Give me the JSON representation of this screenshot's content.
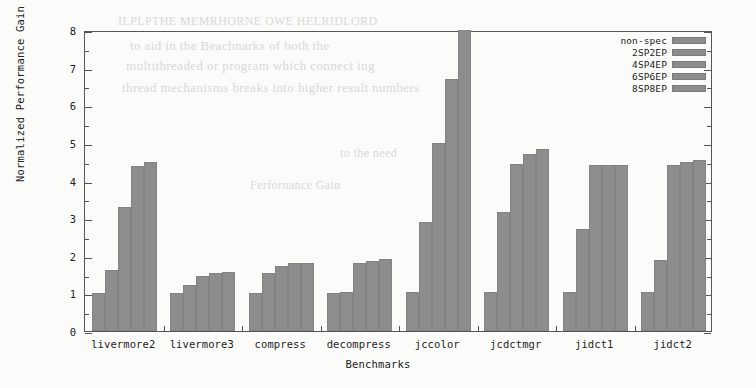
{
  "chart_data": {
    "type": "bar",
    "title": "",
    "xlabel": "Benchmarks",
    "ylabel": "Normalized Performance Gain",
    "ylim": [
      0,
      8
    ],
    "yticks": [
      0,
      1,
      2,
      3,
      4,
      5,
      6,
      7,
      8
    ],
    "grid": false,
    "legend_position": "top-right",
    "bar_color": "#8d8d8d",
    "categories": [
      "livermore2",
      "livermore3",
      "compress",
      "decompress",
      "jccolor",
      "jcdctmgr",
      "jidct1",
      "jidct2"
    ],
    "series": [
      {
        "name": "non-spec",
        "values": [
          1.0,
          1.0,
          1.0,
          1.0,
          1.05,
          1.05,
          1.05,
          1.05
        ]
      },
      {
        "name": "2SP2EP",
        "values": [
          1.62,
          1.22,
          1.55,
          1.05,
          2.9,
          3.15,
          2.7,
          1.9
        ]
      },
      {
        "name": "4SP4EP",
        "values": [
          3.3,
          1.45,
          1.72,
          1.8,
          5.0,
          4.45,
          4.4,
          4.4
        ]
      },
      {
        "name": "6SP6EP",
        "values": [
          4.38,
          1.55,
          1.8,
          1.85,
          6.7,
          4.7,
          4.42,
          4.5
        ]
      },
      {
        "name": "8SP8EP",
        "values": [
          4.5,
          1.58,
          1.82,
          1.92,
          8.0,
          4.85,
          4.42,
          4.55
        ]
      }
    ]
  },
  "legend": {
    "entries": [
      "non-spec",
      "2SP2EP",
      "4SP4EP",
      "6SP6EP",
      "8SP8EP"
    ]
  },
  "ghost_text": [
    {
      "text": "ILPLPTHE MEMRHORNE OWE HELRIDLORD",
      "x": 118,
      "y": 14,
      "size": 12
    },
    {
      "text": "to aid in the Beachnarks of both the",
      "x": 130,
      "y": 38,
      "size": 13
    },
    {
      "text": "multithreaded or program which connect ing",
      "x": 126,
      "y": 58,
      "size": 13
    },
    {
      "text": "thread mechanisms breaks into higher result numbers",
      "x": 122,
      "y": 80,
      "size": 13
    },
    {
      "text": "to the need",
      "x": 340,
      "y": 146,
      "size": 12
    },
    {
      "text": "Ferfornance Gain",
      "x": 250,
      "y": 178,
      "size": 12
    }
  ]
}
